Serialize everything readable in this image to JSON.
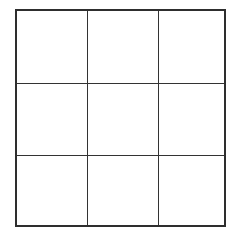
{
  "board": {
    "rows": 3,
    "cols": 3,
    "line_color": "#333333",
    "background": "#ffffff",
    "cells": [
      {
        "row": 0,
        "col": 0,
        "value": ""
      },
      {
        "row": 0,
        "col": 1,
        "value": ""
      },
      {
        "row": 0,
        "col": 2,
        "value": ""
      },
      {
        "row": 1,
        "col": 0,
        "value": ""
      },
      {
        "row": 1,
        "col": 1,
        "value": ""
      },
      {
        "row": 1,
        "col": 2,
        "value": ""
      },
      {
        "row": 2,
        "col": 0,
        "value": ""
      },
      {
        "row": 2,
        "col": 1,
        "value": ""
      },
      {
        "row": 2,
        "col": 2,
        "value": ""
      }
    ]
  }
}
